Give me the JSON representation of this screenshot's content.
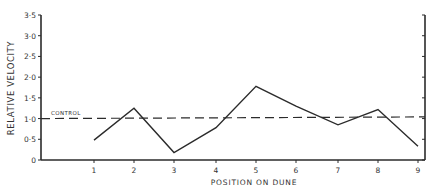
{
  "chart_data": {
    "type": "line",
    "title": "",
    "xlabel": "POSITION ON DUNE",
    "ylabel": "RELATIVE VELOCITY",
    "categories": [
      "1",
      "2",
      "3",
      "4",
      "5",
      "6",
      "7",
      "8",
      "9"
    ],
    "x": [
      1,
      2,
      3,
      4,
      5,
      6,
      7,
      8,
      9
    ],
    "series": [
      {
        "name": "Relative velocity",
        "values": [
          0.48,
          1.25,
          0.18,
          0.78,
          1.78,
          1.3,
          0.85,
          1.22,
          0.33
        ],
        "style": "solid"
      }
    ],
    "reference_lines": [
      {
        "name": "CONTROL",
        "y_start": 1.0,
        "y_end": 1.04,
        "style": "dashed",
        "label": "CONTROL"
      }
    ],
    "yticks": [
      "0",
      "0·5",
      "1·0",
      "1·5",
      "2·0",
      "2·5",
      "3·0",
      "3·5"
    ],
    "ytick_values": [
      0,
      0.5,
      1.0,
      1.5,
      2.0,
      2.5,
      3.0,
      3.5
    ],
    "ylim": [
      0,
      3.5
    ],
    "xlim": [
      0,
      9.2
    ],
    "grid": false,
    "legend": "none",
    "right_axis": true
  },
  "colors": {
    "line": "#2b2b2b",
    "axis": "#2b2b2b",
    "text": "#333333",
    "background": "#ffffff"
  }
}
